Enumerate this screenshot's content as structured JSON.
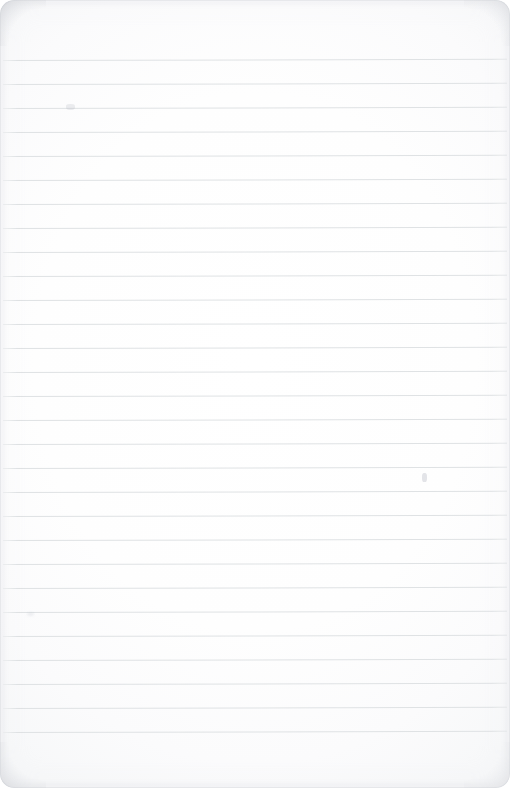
{
  "document": {
    "type": "lined-notepad-page",
    "title": "Blank Ruled Notepad Page",
    "content_text": "",
    "visible_text_lines": [],
    "page_width_px": 510,
    "page_height_px": 788
  },
  "paper": {
    "background_color": "#fdfdfd",
    "corner_radius_px": 14,
    "edge_shadow_color": "#ced1d6"
  },
  "ruling": {
    "line_color": "#dfe2e4",
    "line_thickness_px": 1,
    "line_spacing_px": 24,
    "first_line_y_px": 60,
    "last_line_y_px": 744,
    "line_count": 29,
    "line_left_x_px": 3,
    "line_right_x_px": 507,
    "tilt_degrees": -0.14,
    "top_margin_px": 60,
    "bottom_margin_px": 44,
    "lines_y": [
      60,
      84,
      108,
      132,
      156,
      180,
      204,
      228,
      252,
      276,
      300,
      324,
      348,
      372,
      396,
      420,
      444,
      468,
      492,
      516,
      540,
      564,
      588,
      612,
      636,
      660,
      684,
      708,
      732
    ]
  },
  "marks": [
    {
      "name": "smudge-upper-left",
      "x": 66,
      "y": 104,
      "note": "faint gray speck on rule line"
    },
    {
      "name": "smudge-mid-right",
      "x": 422,
      "y": 473,
      "note": "faint vertical pencil tick"
    },
    {
      "name": "smudge-lower-left",
      "x": 27,
      "y": 612,
      "note": "very faint gray speck"
    }
  ]
}
